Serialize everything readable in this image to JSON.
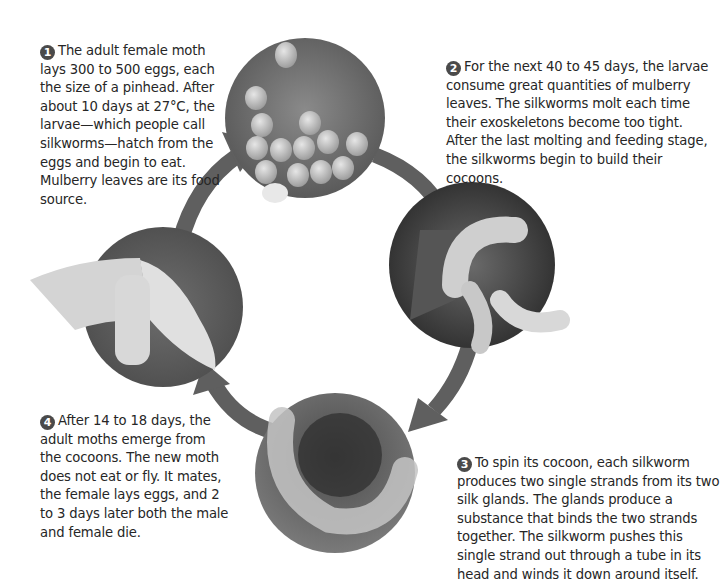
{
  "diagram": {
    "stages": [
      {
        "number": "1",
        "image": "silkworm-eggs",
        "text": "The adult female moth lays 300 to 500 eggs, each the size of a pinhead. After about 10 days at 27°C, the larvae—which people call silkworms—hatch from the eggs and begin to eat. Mulberry leaves are its food source."
      },
      {
        "number": "2",
        "image": "silkworm-larvae-on-mulberry-leaves",
        "text": "For the next 40 to 45 days, the larvae consume great quantities of mulberry leaves. The silkworms molt each time their exoskeletons become too tight. After the last molting and feeding stage, the silkworms begin to build their cocoons."
      },
      {
        "number": "3",
        "image": "silkworm-spinning-cocoon",
        "text": "To spin its cocoon, each silkworm produces two single strands from its two silk glands. The glands produce a substance that binds the two strands together. The silkworm pushes this single strand out through a tube in its head and winds it down around itself."
      },
      {
        "number": "4",
        "image": "adult-silk-moth",
        "text": "After 14 to 18 days, the adult moths emerge from the cocoons. The new moth does not eat or fly. It mates, the female lays eggs, and 2 to 3 days later both the male and female die."
      }
    ],
    "colors": {
      "arrow": "#5f5f5f",
      "badge": "#4a4a4a",
      "text": "#262626",
      "background": "#ffffff"
    }
  }
}
